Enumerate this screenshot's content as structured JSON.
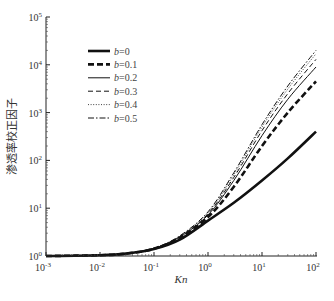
{
  "chart_data": {
    "type": "line",
    "title": "",
    "xlabel": "Kn",
    "ylabel": "渗透率校正因子",
    "xscale": "log",
    "yscale": "log",
    "xlim": [
      0.001,
      100
    ],
    "ylim": [
      1,
      100000
    ],
    "grid": false,
    "legend_position": "upper left (inside)",
    "x_ticks": [
      {
        "base": "10",
        "exp": "-3",
        "value": 0.001
      },
      {
        "base": "10",
        "exp": "-2",
        "value": 0.01
      },
      {
        "base": "10",
        "exp": "-1",
        "value": 0.1
      },
      {
        "base": "10",
        "exp": "0",
        "value": 1
      },
      {
        "base": "10",
        "exp": "1",
        "value": 10
      },
      {
        "base": "10",
        "exp": "2",
        "value": 100
      }
    ],
    "y_ticks": [
      {
        "base": "10",
        "exp": "0",
        "value": 1
      },
      {
        "base": "10",
        "exp": "1",
        "value": 10
      },
      {
        "base": "10",
        "exp": "2",
        "value": 100
      },
      {
        "base": "10",
        "exp": "3",
        "value": 1000
      },
      {
        "base": "10",
        "exp": "4",
        "value": 10000
      },
      {
        "base": "10",
        "exp": "5",
        "value": 100000
      }
    ],
    "x": [
      0.001,
      0.01,
      0.03,
      0.1,
      0.3,
      1,
      3,
      10,
      30,
      100
    ],
    "series": [
      {
        "name": "b=0",
        "var": "b",
        "val": "=0",
        "style": "solid-thick",
        "values": [
          1.0,
          1.04,
          1.12,
          1.4,
          2.2,
          5.5,
          13,
          38,
          110,
          400
        ]
      },
      {
        "name": "b=0.1",
        "var": "b",
        "val": "=0.1",
        "style": "dashed-thick",
        "values": [
          1.0,
          1.04,
          1.12,
          1.42,
          2.4,
          6.5,
          28,
          200,
          1000,
          4500
        ]
      },
      {
        "name": "b=0.2",
        "var": "b",
        "val": "=0.2",
        "style": "solid-thin",
        "values": [
          1.0,
          1.04,
          1.12,
          1.43,
          2.5,
          7.2,
          38,
          330,
          1900,
          9000
        ]
      },
      {
        "name": "b=0.3",
        "var": "b",
        "val": "=0.3",
        "style": "dashed-thin",
        "values": [
          1.0,
          1.04,
          1.12,
          1.44,
          2.55,
          7.6,
          44,
          420,
          2500,
          13000
        ]
      },
      {
        "name": "b=0.4",
        "var": "b",
        "val": "=0.4",
        "style": "dotted",
        "values": [
          1.0,
          1.04,
          1.12,
          1.45,
          2.6,
          8.0,
          50,
          500,
          3100,
          17000
        ]
      },
      {
        "name": "b=0.5",
        "var": "b",
        "val": "=0.5",
        "style": "dashdot",
        "values": [
          1.0,
          1.04,
          1.12,
          1.46,
          2.65,
          8.4,
          55,
          560,
          3600,
          20000
        ]
      }
    ]
  }
}
